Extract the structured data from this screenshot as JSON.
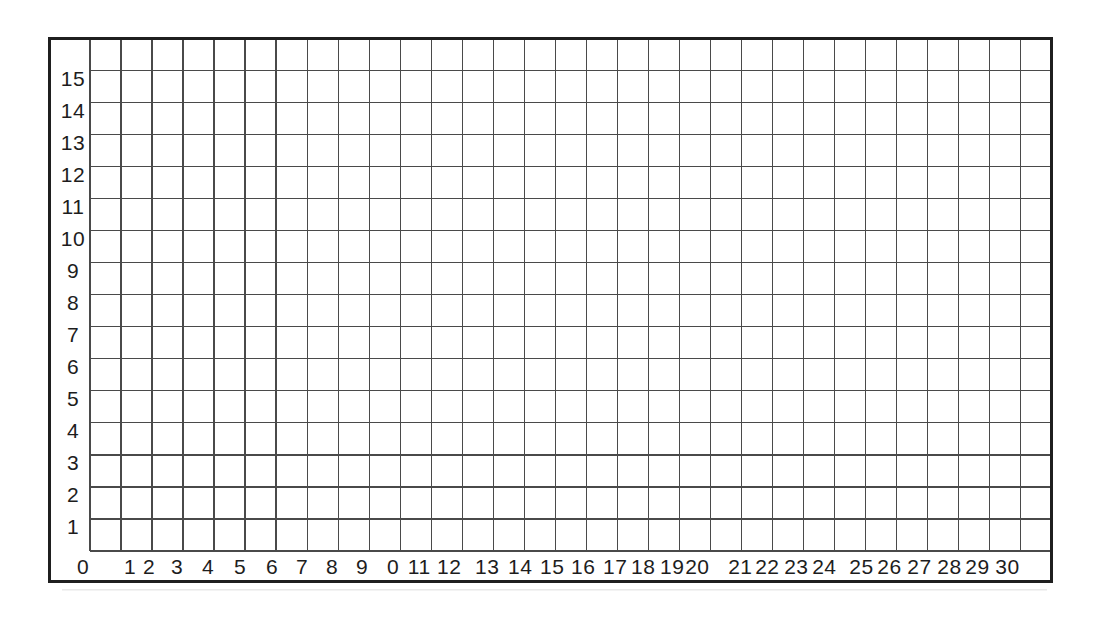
{
  "page": {
    "background_color": "#ffffff"
  },
  "chart_data": {
    "type": "scatter",
    "title": "",
    "xlabel": "",
    "ylabel": "",
    "series": [],
    "grid": "on",
    "grid_columns": 31,
    "grid_rows": 16,
    "frame": "rectangular border enclosing grid with axis label margins at left and bottom",
    "x_axis": {
      "tick_labels": [
        "0",
        "1",
        "2",
        "3",
        "4",
        "5",
        "6",
        "7",
        "8",
        "9",
        "0",
        "11",
        "12",
        "13",
        "14",
        "15",
        "16",
        "17",
        "18",
        "19",
        "20",
        "21",
        "22",
        "23",
        "24",
        "25",
        "26",
        "27",
        "28",
        "29",
        "30"
      ],
      "range": [
        0,
        31
      ],
      "position": "bottom"
    },
    "y_axis": {
      "tick_labels": [
        "15",
        "14",
        "13",
        "12",
        "11",
        "10",
        "9",
        "8",
        "7",
        "6",
        "5",
        "4",
        "3",
        "2",
        "1"
      ],
      "order": "top-to-bottom",
      "range": [
        0,
        16
      ],
      "position": "left"
    },
    "colors": {
      "grid_line": "#4a4a4a",
      "frame_line": "#1f1f1f",
      "label_text": "#1d1d1d",
      "background": "#ffffff"
    }
  }
}
